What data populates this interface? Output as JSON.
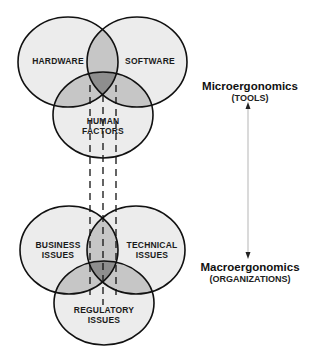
{
  "top_venn": {
    "name": "Microergonomics tools Venn diagram",
    "circles": [
      {
        "id": "hardware",
        "label_lines": [
          "HARDWARE"
        ]
      },
      {
        "id": "software",
        "label_lines": [
          "SOFTWARE"
        ]
      },
      {
        "id": "human_factors",
        "label_lines": [
          "HUMAN",
          "FACTORS"
        ]
      }
    ]
  },
  "bottom_venn": {
    "name": "Macroergonomics organizations Venn diagram",
    "circles": [
      {
        "id": "business_issues",
        "label_lines": [
          "BUSINESS",
          "ISSUES"
        ]
      },
      {
        "id": "technical_issues",
        "label_lines": [
          "TECHNICAL",
          "ISSUES"
        ]
      },
      {
        "id": "regulatory_issues",
        "label_lines": [
          "REGULATORY",
          "ISSUES"
        ]
      }
    ]
  },
  "connector": {
    "style": "dashed",
    "count": 3
  },
  "scale": {
    "top": {
      "title": "Microergonomics",
      "subtitle": "(TOOLS)"
    },
    "bottom": {
      "title": "Macroergonomics",
      "subtitle": "(ORGANIZATIONS)"
    },
    "arrow": "bidirectional-vertical"
  },
  "colors": {
    "circle_fill": "#ececec",
    "pair_overlap_fill": "#c6c6c6",
    "triple_overlap_fill": "#8e8e8e",
    "stroke": "#111111",
    "arrow": "#b5b5b5"
  }
}
